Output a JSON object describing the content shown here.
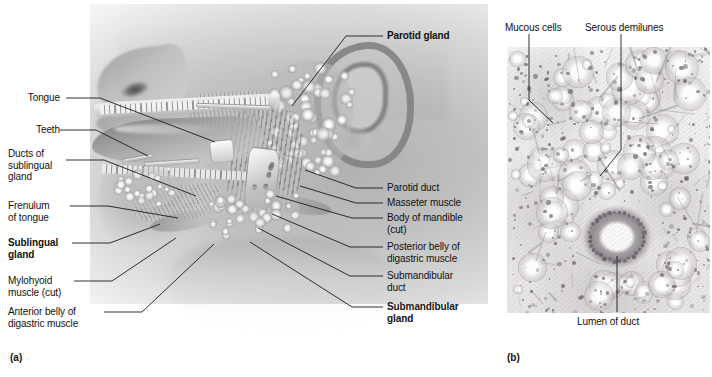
{
  "figure": {
    "type": "anatomical-illustration-plate",
    "panels": [
      {
        "id": "a",
        "caption": "(a)",
        "kind": "lateral-head-illustration"
      },
      {
        "id": "b",
        "caption": "(b)",
        "kind": "light-micrograph"
      }
    ]
  },
  "panel_a": {
    "caption": "(a)",
    "labels_left": [
      {
        "name": "tongue",
        "text": "Tongue",
        "bold": false
      },
      {
        "name": "teeth",
        "text": "Teeth",
        "bold": false
      },
      {
        "name": "ducts-of-sublingual-gland",
        "text": "Ducts of\nsublingual\ngland",
        "bold": false
      },
      {
        "name": "frenulum-of-tongue",
        "text": "Frenulum\nof tongue",
        "bold": false
      },
      {
        "name": "sublingual-gland",
        "text": "Sublingual\ngland",
        "bold": true
      },
      {
        "name": "mylohyoid-muscle-cut",
        "text": "Mylohyoid\nmuscle (cut)",
        "bold": false
      },
      {
        "name": "anterior-belly-of-digastric-muscle",
        "text": "Anterior belly of\ndigastric muscle",
        "bold": false
      }
    ],
    "labels_right": [
      {
        "name": "parotid-gland",
        "text": "Parotid gland",
        "bold": true
      },
      {
        "name": "parotid-duct",
        "text": "Parotid duct",
        "bold": false
      },
      {
        "name": "masseter-muscle",
        "text": "Masseter muscle",
        "bold": false
      },
      {
        "name": "body-of-mandible-cut",
        "text": "Body of mandible\n(cut)",
        "bold": false
      },
      {
        "name": "posterior-belly-of-digastric-muscle",
        "text": "Posterior belly of\ndigastric muscle",
        "bold": false
      },
      {
        "name": "submandibular-duct",
        "text": "Submandibular\nduct",
        "bold": false
      },
      {
        "name": "submandibular-gland",
        "text": "Submandibular\ngland",
        "bold": true
      }
    ]
  },
  "panel_b": {
    "caption": "(b)",
    "labels": [
      {
        "name": "mucous-cells",
        "text": "Mucous cells"
      },
      {
        "name": "serous-demilunes",
        "text": "Serous demilunes"
      },
      {
        "name": "lumen-of-duct",
        "text": "Lumen of duct"
      }
    ]
  },
  "colors": {
    "background": "#ffffff",
    "text": "#111111",
    "leader_line": "#1a1a1a",
    "illustration_gray": "#b4b4b4",
    "micrograph_base": "#efeeec",
    "micrograph_nuclei": "#5c585e"
  }
}
